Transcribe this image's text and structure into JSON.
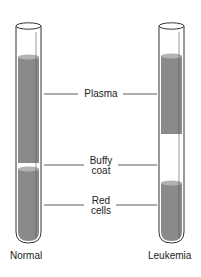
{
  "diagram": {
    "title": "",
    "tubes": [
      {
        "id": "normal",
        "caption": "Normal",
        "layers": {
          "plasma": [
            57,
            163
          ],
          "buffy_coat": [
            163,
            169
          ],
          "red_cells": [
            169,
            240
          ]
        }
      },
      {
        "id": "leukemia",
        "caption": "Leukemia",
        "layers": {
          "plasma": [
            56,
            134
          ],
          "buffy_coat": [
            134,
            183
          ],
          "red_cells": [
            183,
            240
          ]
        }
      }
    ],
    "labels": {
      "plasma": "Plasma",
      "buffy_line1": "Buffy",
      "buffy_line2": "coat",
      "red_line1": "Red",
      "red_line2": "cells"
    },
    "colors": {
      "fill": "#8a8a8a",
      "fill_top": "#b3b3b3",
      "outline": "#333333",
      "line": "#333333"
    }
  }
}
